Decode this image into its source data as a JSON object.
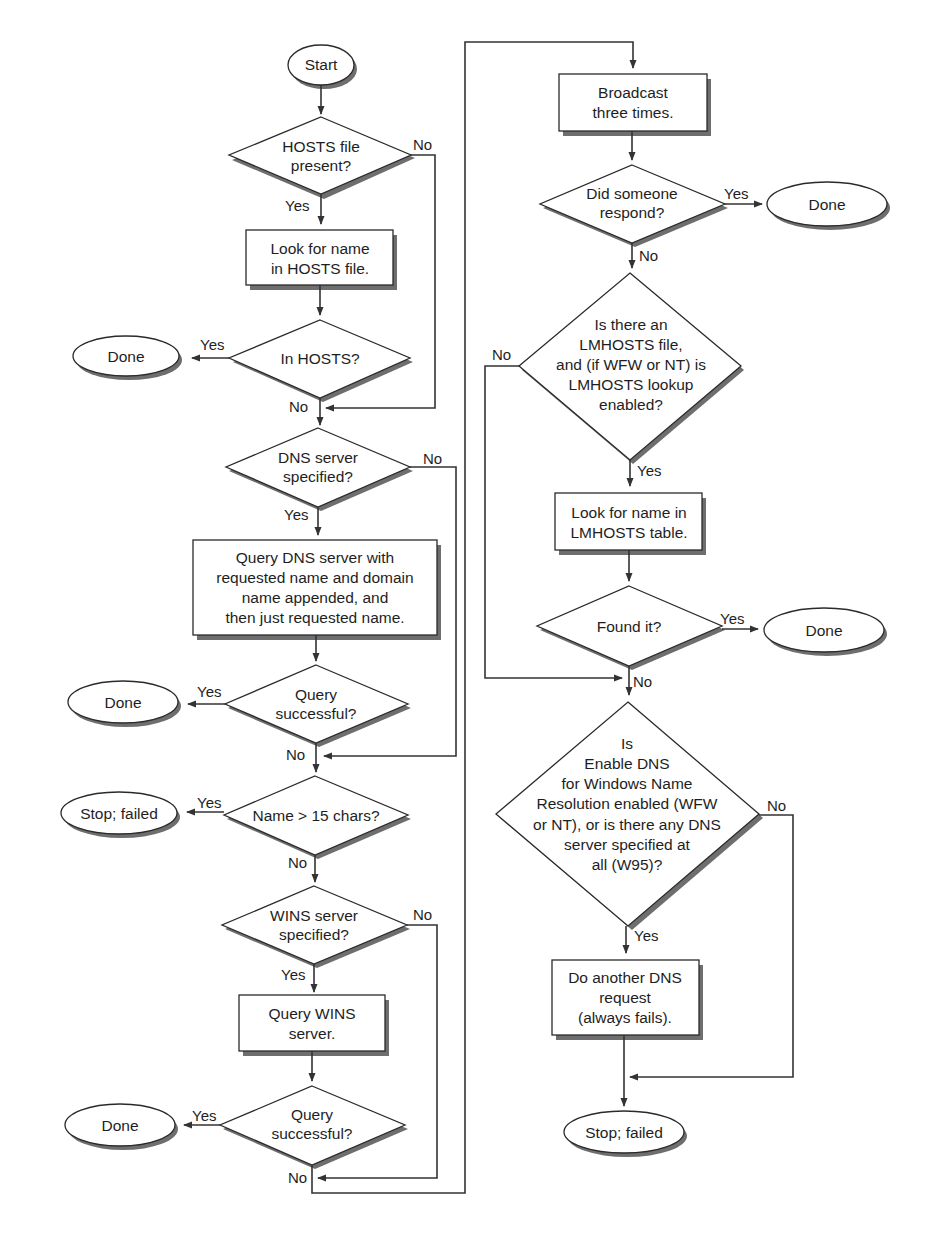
{
  "diagram": {
    "type": "flowchart",
    "nodes": {
      "start": {
        "shape": "terminator",
        "text": "Start"
      },
      "hosts_present": {
        "shape": "decision",
        "lines": [
          "HOSTS file",
          "present?"
        ]
      },
      "look_hosts": {
        "shape": "process",
        "lines": [
          "Look for name",
          "in HOSTS file."
        ]
      },
      "in_hosts": {
        "shape": "decision",
        "lines": [
          "In HOSTS?"
        ]
      },
      "done_1": {
        "shape": "terminator",
        "text": "Done"
      },
      "dns_specified": {
        "shape": "decision",
        "lines": [
          "DNS server",
          "specified?"
        ]
      },
      "query_dns": {
        "shape": "process",
        "lines": [
          "Query DNS server with",
          "requested name and domain",
          "name appended, and",
          "then just requested name."
        ]
      },
      "dns_success": {
        "shape": "decision",
        "lines": [
          "Query",
          "successful?"
        ]
      },
      "done_2": {
        "shape": "terminator",
        "text": "Done"
      },
      "name_len": {
        "shape": "decision",
        "lines": [
          "Name > 15 chars?"
        ]
      },
      "stop_1": {
        "shape": "terminator",
        "text": "Stop; failed"
      },
      "wins_specified": {
        "shape": "decision",
        "lines": [
          "WINS server",
          "specified?"
        ]
      },
      "query_wins": {
        "shape": "process",
        "lines": [
          "Query WINS",
          "server."
        ]
      },
      "wins_success": {
        "shape": "decision",
        "lines": [
          "Query",
          "successful?"
        ]
      },
      "done_3": {
        "shape": "terminator",
        "text": "Done"
      },
      "broadcast": {
        "shape": "process",
        "lines": [
          "Broadcast",
          "three times."
        ]
      },
      "respond": {
        "shape": "decision",
        "lines": [
          "Did someone",
          "respond?"
        ]
      },
      "done_4": {
        "shape": "terminator",
        "text": "Done"
      },
      "lmhosts_enabled": {
        "shape": "decision",
        "lines": [
          "Is there an",
          "LMHOSTS file,",
          "and (if WFW or NT) is",
          "LMHOSTS lookup",
          "enabled?"
        ]
      },
      "look_lmhosts": {
        "shape": "process",
        "lines": [
          "Look for name in",
          "LMHOSTS table."
        ]
      },
      "found": {
        "shape": "decision",
        "lines": [
          "Found it?"
        ]
      },
      "done_5": {
        "shape": "terminator",
        "text": "Done"
      },
      "dns_enabled": {
        "shape": "decision",
        "lines": [
          "Is",
          "Enable DNS",
          "for Windows Name",
          "Resolution enabled (WFW",
          "or NT), or is there any DNS",
          "server specified at",
          "all (W95)?"
        ]
      },
      "another_dns": {
        "shape": "process",
        "lines": [
          "Do another DNS",
          "request",
          "(always fails)."
        ]
      },
      "stop_2": {
        "shape": "terminator",
        "text": "Stop; failed"
      }
    },
    "edge_labels": {
      "yes": "Yes",
      "no": "No"
    },
    "edges": [
      {
        "from": "start",
        "to": "hosts_present",
        "label": ""
      },
      {
        "from": "hosts_present",
        "to": "look_hosts",
        "label": "Yes"
      },
      {
        "from": "hosts_present",
        "to": "dns_specified",
        "label": "No"
      },
      {
        "from": "look_hosts",
        "to": "in_hosts",
        "label": ""
      },
      {
        "from": "in_hosts",
        "to": "done_1",
        "label": "Yes"
      },
      {
        "from": "in_hosts",
        "to": "dns_specified",
        "label": "No"
      },
      {
        "from": "dns_specified",
        "to": "query_dns",
        "label": "Yes"
      },
      {
        "from": "dns_specified",
        "to": "name_len",
        "label": "No"
      },
      {
        "from": "query_dns",
        "to": "dns_success",
        "label": ""
      },
      {
        "from": "dns_success",
        "to": "done_2",
        "label": "Yes"
      },
      {
        "from": "dns_success",
        "to": "name_len",
        "label": "No"
      },
      {
        "from": "name_len",
        "to": "stop_1",
        "label": "Yes"
      },
      {
        "from": "name_len",
        "to": "wins_specified",
        "label": "No"
      },
      {
        "from": "wins_specified",
        "to": "query_wins",
        "label": "Yes"
      },
      {
        "from": "wins_specified",
        "to": "broadcast",
        "label": "No"
      },
      {
        "from": "query_wins",
        "to": "wins_success",
        "label": ""
      },
      {
        "from": "wins_success",
        "to": "done_3",
        "label": "Yes"
      },
      {
        "from": "wins_success",
        "to": "broadcast",
        "label": "No"
      },
      {
        "from": "broadcast",
        "to": "respond",
        "label": ""
      },
      {
        "from": "respond",
        "to": "done_4",
        "label": "Yes"
      },
      {
        "from": "respond",
        "to": "lmhosts_enabled",
        "label": "No"
      },
      {
        "from": "lmhosts_enabled",
        "to": "look_lmhosts",
        "label": "Yes"
      },
      {
        "from": "lmhosts_enabled",
        "to": "dns_enabled",
        "label": "No"
      },
      {
        "from": "look_lmhosts",
        "to": "found",
        "label": ""
      },
      {
        "from": "found",
        "to": "done_5",
        "label": "Yes"
      },
      {
        "from": "found",
        "to": "dns_enabled",
        "label": "No"
      },
      {
        "from": "dns_enabled",
        "to": "another_dns",
        "label": "Yes"
      },
      {
        "from": "dns_enabled",
        "to": "stop_2",
        "label": "No"
      },
      {
        "from": "another_dns",
        "to": "stop_2",
        "label": ""
      }
    ]
  },
  "colors": {
    "stroke": "#2a2a2a",
    "shadow": "#6e6e6e",
    "background": "#ffffff"
  }
}
